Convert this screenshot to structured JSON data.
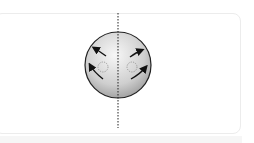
{
  "diagram": {
    "title": "",
    "sphere": {
      "cx": 118,
      "cy": 65,
      "r": 33
    },
    "axis": {
      "x": 118,
      "y1": 13,
      "y2": 128,
      "style": "dotted"
    },
    "left_half": {
      "arrows": [
        {
          "direction": "up-left",
          "from": [
            106,
            56
          ],
          "to": [
            93,
            48
          ]
        },
        {
          "direction": "up-left",
          "from": [
            103,
            79
          ],
          "to": [
            89,
            64
          ]
        }
      ],
      "marker": {
        "type": "dashed-circle",
        "cx": 103,
        "cy": 67,
        "r": 5
      }
    },
    "right_half": {
      "arrows": [
        {
          "direction": "up-right",
          "from": [
            130,
            57
          ],
          "to": [
            143,
            49
          ]
        },
        {
          "direction": "up-right",
          "from": [
            131,
            79
          ],
          "to": [
            147,
            66
          ]
        }
      ],
      "marker": {
        "type": "dashed-circle",
        "cx": 132,
        "cy": 67,
        "r": 5
      }
    },
    "colors": {
      "sphere_light": "#f2f2f2",
      "sphere_dark": "#9a9a9a",
      "stroke": "#111111",
      "marker": "#888888",
      "card_border": "#ececec"
    }
  }
}
